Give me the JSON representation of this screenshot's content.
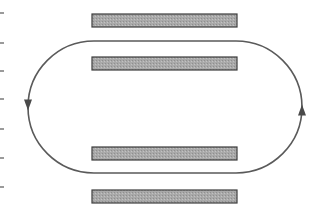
{
  "diagram": {
    "title": "",
    "colors": {
      "bar_fill": "#a9a9a9",
      "bar_stroke": "#3c3c3c",
      "loop_stroke": "#5a5a5a",
      "background": "#ffffff"
    },
    "bars": [
      {
        "id": "bar-1",
        "x": 92,
        "y": 14,
        "width": 145,
        "height": 13
      },
      {
        "id": "bar-2",
        "x": 92,
        "y": 57,
        "width": 145,
        "height": 13
      },
      {
        "id": "bar-3",
        "x": 92,
        "y": 147,
        "width": 145,
        "height": 13
      },
      {
        "id": "bar-4",
        "x": 92,
        "y": 190,
        "width": 145,
        "height": 13
      }
    ],
    "loop": {
      "shape": "stadium",
      "left_x": 28,
      "right_x": 302,
      "top_y": 41,
      "bottom_y": 173,
      "direction": "counterclockwise",
      "arrows": [
        {
          "side": "left",
          "points": "down",
          "x": 28,
          "y": 105
        },
        {
          "side": "right",
          "points": "up",
          "x": 302,
          "y": 110
        }
      ]
    },
    "left_edge_marks_y": [
      12,
      42,
      70,
      98,
      128,
      157,
      186
    ]
  }
}
